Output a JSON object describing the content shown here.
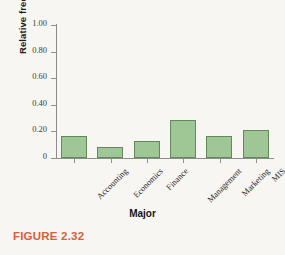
{
  "figure": {
    "caption": "FIGURE 2.32",
    "caption_color": "#d4603c",
    "top_cutoff_text": ""
  },
  "chart_data": {
    "type": "bar",
    "title": "",
    "categories": [
      "Accounting",
      "Economics",
      "Finance",
      "Management",
      "Marketing",
      "MIS"
    ],
    "values": [
      0.165,
      0.085,
      0.125,
      0.285,
      0.165,
      0.21
    ],
    "xlabel": "Major",
    "ylabel": "Relative frequency",
    "ylim": [
      0,
      1.0
    ],
    "ytick_labels": [
      "0",
      "0.20",
      "0.40",
      "0.60",
      "0.80",
      "1.00"
    ],
    "ytick_values": [
      0,
      0.2,
      0.4,
      0.6,
      0.8,
      1.0
    ],
    "grid": false,
    "legend": false,
    "bar_fill": "#9fc795",
    "bar_edge": "#63885c"
  }
}
